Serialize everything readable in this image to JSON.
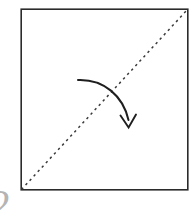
{
  "figure": {
    "canvas": {
      "width": 196,
      "height": 210,
      "background": "#ffffff"
    },
    "page_mark": {
      "text": "2",
      "color": "#b4b4b4"
    },
    "shapes": {
      "square": {
        "name": "paper-square",
        "x": 21,
        "y": 9,
        "width": 167,
        "height": 181,
        "stroke": "#2b2b2b",
        "stroke_width": 1.6,
        "fill": "#ffffff"
      },
      "fold_line": {
        "name": "diagonal-fold-line",
        "style": "dashed",
        "x1": 21,
        "y1": 190,
        "x2": 188,
        "y2": 9,
        "stroke": "#3a3a3a",
        "stroke_width": 1.5,
        "dash_pattern": "2.4 3.6"
      },
      "fold_arrow": {
        "name": "fold-direction-arrow",
        "path": "M 78 80 C 104 79 123 96 128.5 120",
        "head_points": "120.5,115.5 128.6,127.5 136,114.5",
        "stroke": "#1f1f1f",
        "stroke_width": 2.0,
        "direction": "down"
      }
    }
  },
  "chart_data": {
    "type": "diagram",
    "elements": [
      {
        "id": "square",
        "kind": "rectangle",
        "label": "paper sheet",
        "corners": [
          [
            21,
            9
          ],
          [
            188,
            9
          ],
          [
            188,
            190
          ],
          [
            21,
            190
          ]
        ]
      },
      {
        "id": "fold-line",
        "kind": "dashed-line",
        "label": "valley fold (diagonal)",
        "from": [
          21,
          190
        ],
        "to": [
          188,
          9
        ]
      },
      {
        "id": "fold-arrow",
        "kind": "curved-arrow",
        "label": "fold direction",
        "from": [
          78,
          80
        ],
        "to": [
          128,
          128
        ]
      }
    ]
  }
}
